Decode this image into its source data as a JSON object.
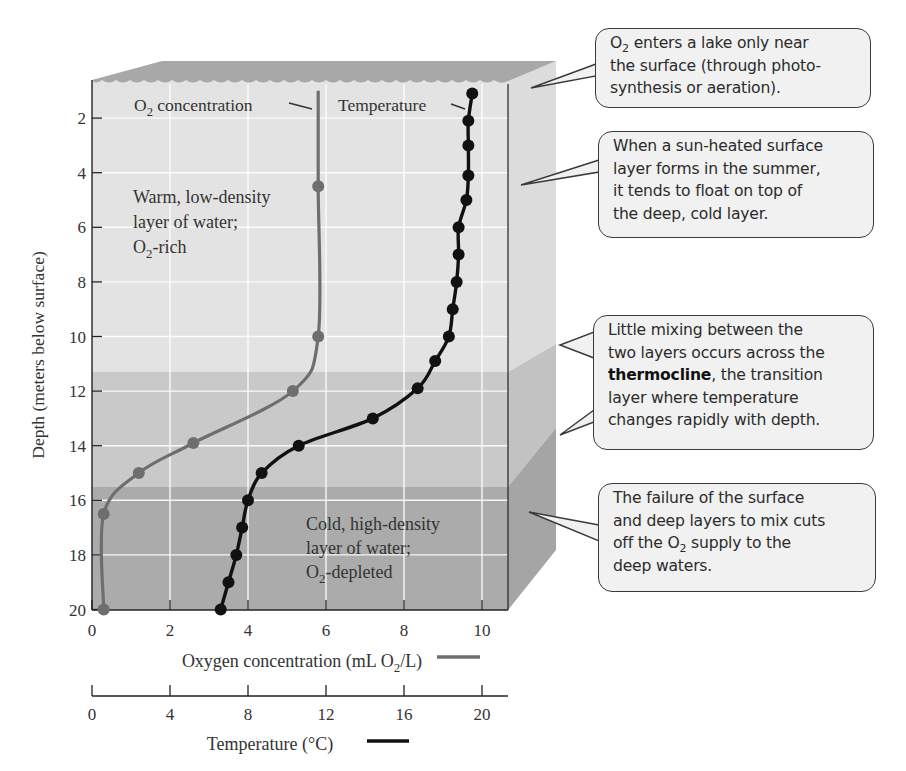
{
  "chart_data": {
    "type": "line",
    "title": "",
    "orientation": "vertical profile (depth on y-axis, inverted)",
    "ylabel": "Depth (meters below surface)",
    "ylim": [
      0,
      20
    ],
    "y_ticks": [
      2,
      4,
      6,
      8,
      10,
      12,
      14,
      16,
      18,
      20
    ],
    "x_axes": [
      {
        "id": "oxygen",
        "label": "Oxygen concentration (mL O2/L)",
        "ticks": [
          0,
          2,
          4,
          6,
          8,
          10
        ],
        "xlim": [
          0,
          10.67
        ],
        "legend_color": "#6e6e6e"
      },
      {
        "id": "temperature",
        "label": "Temperature (°C)",
        "ticks": [
          0,
          4,
          8,
          12,
          16,
          20
        ],
        "xlim": [
          0,
          21.3
        ],
        "legend_color": "#111111"
      }
    ],
    "grid": true,
    "series": [
      {
        "name": "O2 concentration",
        "axis": "oxygen",
        "color": "#6e6e6e",
        "points": [
          {
            "depth": 1.0,
            "value": 5.8,
            "marker": false
          },
          {
            "depth": 4.5,
            "value": 5.8
          },
          {
            "depth": 10.0,
            "value": 5.8
          },
          {
            "depth": 12.0,
            "value": 5.15
          },
          {
            "depth": 13.9,
            "value": 2.6
          },
          {
            "depth": 15.0,
            "value": 1.2
          },
          {
            "depth": 16.5,
            "value": 0.3
          },
          {
            "depth": 20.0,
            "value": 0.3
          }
        ]
      },
      {
        "name": "Temperature",
        "axis": "temperature",
        "color": "#111111",
        "points": [
          {
            "depth": 1.1,
            "value": 19.5
          },
          {
            "depth": 2.1,
            "value": 19.3
          },
          {
            "depth": 3.0,
            "value": 19.3
          },
          {
            "depth": 4.1,
            "value": 19.3
          },
          {
            "depth": 5.0,
            "value": 19.2
          },
          {
            "depth": 6.0,
            "value": 18.8
          },
          {
            "depth": 7.0,
            "value": 18.8
          },
          {
            "depth": 8.0,
            "value": 18.7
          },
          {
            "depth": 9.0,
            "value": 18.5
          },
          {
            "depth": 10.0,
            "value": 18.3
          },
          {
            "depth": 10.9,
            "value": 17.6
          },
          {
            "depth": 11.9,
            "value": 16.7
          },
          {
            "depth": 13.0,
            "value": 14.4
          },
          {
            "depth": 14.0,
            "value": 10.6
          },
          {
            "depth": 15.0,
            "value": 8.7
          },
          {
            "depth": 16.0,
            "value": 8.0
          },
          {
            "depth": 17.0,
            "value": 7.7
          },
          {
            "depth": 18.0,
            "value": 7.4
          },
          {
            "depth": 19.0,
            "value": 7.0
          },
          {
            "depth": 20.0,
            "value": 6.6
          }
        ]
      }
    ],
    "layers": [
      {
        "name": "surface layer",
        "depth_from": 0,
        "depth_to": 11.3,
        "color": "#e3e3e3"
      },
      {
        "name": "thermocline",
        "depth_from": 11.3,
        "depth_to": 15.5,
        "color": "#c9c9c9"
      },
      {
        "name": "deep layer",
        "depth_from": 15.5,
        "depth_to": 20,
        "color": "#ababab"
      }
    ],
    "annotations": [
      "O2 concentration",
      "Temperature",
      "Warm, low-density layer of water; O2-rich",
      "Cold, high-density layer of water; O2-depleted"
    ]
  },
  "plot": {
    "series_labels": {
      "oxygen": {
        "main": "O",
        "sub": "2",
        "rest": " concentration"
      },
      "temperature": "Temperature"
    },
    "layer_labels": {
      "warm": [
        "Warm, low-density",
        "layer of water;",
        {
          "main": "O",
          "sub": "2",
          "rest": "-rich"
        }
      ],
      "cold": [
        "Cold, high-density",
        "layer of water;",
        {
          "main": "O",
          "sub": "2",
          "rest": "-depleted"
        }
      ]
    },
    "y_axis_title": "Depth (meters below surface)",
    "y_tick_labels": [
      "2",
      "4",
      "6",
      "8",
      "10",
      "12",
      "14",
      "16",
      "18",
      "20"
    ],
    "oxygen_axis": {
      "tick_labels": [
        "0",
        "2",
        "4",
        "6",
        "8",
        "10"
      ],
      "title_pre": "Oxygen concentration (mL O",
      "title_sub": "2",
      "title_post": "/L)"
    },
    "temperature_axis": {
      "tick_labels": [
        "0",
        "4",
        "8",
        "12",
        "16",
        "20"
      ],
      "title": "Temperature (°C)"
    }
  },
  "callouts": [
    {
      "id": "surface-entry",
      "lines": [
        {
          "pre": "O",
          "sub": "2",
          "post": " enters a lake only near"
        },
        {
          "text": "the surface (through photo-"
        },
        {
          "text": "synthesis or aeration)."
        }
      ]
    },
    {
      "id": "surface-layer",
      "lines": [
        {
          "text": "When a sun-heated surface"
        },
        {
          "text": "layer forms in the summer,"
        },
        {
          "text": "it tends to float on top of"
        },
        {
          "text": "the deep, cold layer."
        }
      ]
    },
    {
      "id": "thermocline",
      "lines": [
        {
          "text": "Little mixing between the"
        },
        {
          "text": "two layers occurs across the"
        },
        {
          "bold": "thermocline",
          "post": ", the transition"
        },
        {
          "text": "layer where temperature"
        },
        {
          "text": "changes rapidly with depth."
        }
      ]
    },
    {
      "id": "deep-layer",
      "lines": [
        {
          "text": "The failure of the surface"
        },
        {
          "text": "and deep layers to mix cuts"
        },
        {
          "pre": "off the O",
          "sub": "2",
          "post": " supply to the"
        },
        {
          "text": "deep waters."
        }
      ]
    }
  ],
  "colors": {
    "surface_layer": "#e3e3e3",
    "thermocline": "#c9c9c9",
    "deep_layer": "#ababab",
    "water_top": "#a8a8a8",
    "oxygen_line": "#6e6e6e",
    "temperature_line": "#111111",
    "callout_bg": "#f1f1f1"
  }
}
